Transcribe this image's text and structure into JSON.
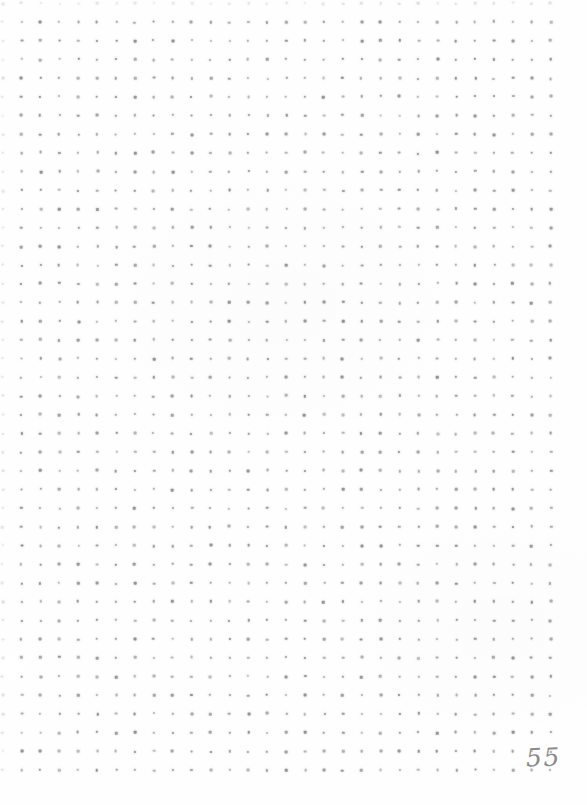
{
  "page": {
    "description_label": "blank dot-grid notebook page",
    "page_number": "55",
    "colors": {
      "background": "#fefefe",
      "dot": "#8f8f8f",
      "page_number": "#8a8a8a"
    },
    "grid": {
      "columns": 29,
      "rows": 41,
      "offset_x": 21.5,
      "offset_y": 22,
      "spacing_x": 18.9,
      "spacing_y": 18.7,
      "dot_size": 2.6
    }
  }
}
